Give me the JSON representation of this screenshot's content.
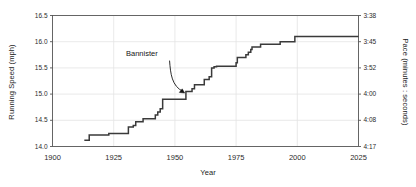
{
  "chart_data": {
    "type": "line",
    "subtype": "step",
    "title": "",
    "xlabel": "Year",
    "ylabel": "Running Speed (mph)",
    "ylabel_right": "Pace (minutes : seconds)",
    "xlim": [
      1900,
      2025
    ],
    "ylim": [
      14.0,
      16.5
    ],
    "grid": true,
    "legend": null,
    "xticks": [
      1900,
      1925,
      1950,
      1975,
      2000,
      2025
    ],
    "xtick_labels": [
      "1900",
      "1925",
      "1950",
      "1975",
      "2000",
      "2025"
    ],
    "yticks": [
      14.0,
      14.5,
      15.0,
      15.5,
      16.0,
      16.5
    ],
    "ytick_labels": [
      "14.0",
      "14.5",
      "15.0",
      "15.5",
      "16.0",
      "16.5"
    ],
    "yticks_right_labels": [
      "4:17",
      "4:08",
      "4:00",
      "3:52",
      "3:45",
      "3:38"
    ],
    "yticks_right_values": [
      14.0,
      14.5,
      15.0,
      15.5,
      16.0,
      16.5
    ],
    "series": [
      {
        "name": "Mile world record running speed",
        "x": [
          1913,
          1915,
          1923,
          1931,
          1933,
          1934,
          1937,
          1942,
          1943,
          1944,
          1945,
          1954,
          1954.5,
          1957,
          1958,
          1962,
          1964,
          1965,
          1966,
          1967,
          1975,
          1975.5,
          1979,
          1980,
          1981,
          1981.5,
          1985,
          1993,
          1999,
          2025
        ],
        "values": [
          14.12,
          14.22,
          14.25,
          14.37,
          14.4,
          14.47,
          14.53,
          14.6,
          14.66,
          14.72,
          14.9,
          14.9,
          15.05,
          15.1,
          15.18,
          15.28,
          15.33,
          15.5,
          15.52,
          15.53,
          15.6,
          15.7,
          15.75,
          15.8,
          15.85,
          15.9,
          15.95,
          16.0,
          16.1,
          16.1
        ]
      }
    ],
    "annotations": [
      {
        "text": "Bannister",
        "points_to_x": 1954,
        "points_to_y": 15.02,
        "label_x": 1947,
        "label_y": 15.62
      }
    ]
  },
  "axes": {
    "left_title": "Running Speed (mph)",
    "right_title": "Pace (minutes : seconds)",
    "bottom_title": "Year"
  },
  "colors": {
    "background": "#ffffff",
    "line": "#3a3a3a",
    "grid": "#e3e3e3",
    "axis": "#555555",
    "text": "#1a1a1a",
    "annotation": "#141414"
  }
}
